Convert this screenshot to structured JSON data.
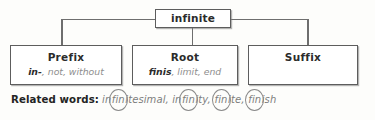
{
  "diagram": {
    "type": "word-analysis-tree",
    "headword": "infinite",
    "parts": [
      {
        "title": "Prefix",
        "term": "in-",
        "meaning": ", not, without",
        "has_meaning": true
      },
      {
        "title": "Root",
        "term": "finis",
        "meaning": ", limit, end",
        "has_meaning": true
      },
      {
        "title": "Suffix",
        "term": "",
        "meaning": "",
        "has_meaning": false
      }
    ],
    "related": {
      "label": "Related words:",
      "words": [
        {
          "pre": "in",
          "circled": "fin",
          "post": "itesimal,"
        },
        {
          "pre": "in",
          "circled": "fin",
          "post": "ity,"
        },
        {
          "pre": "",
          "circled": "fin",
          "post": "ite,"
        },
        {
          "pre": "",
          "circled": "fin",
          "post": "ish"
        }
      ]
    },
    "colors": {
      "line": "#6e6e6e",
      "box_border": "#5d5d5d",
      "title_text": "#2b2b2b",
      "meaning_text": "#8e8e8e",
      "background": "#fdfdfb"
    }
  }
}
